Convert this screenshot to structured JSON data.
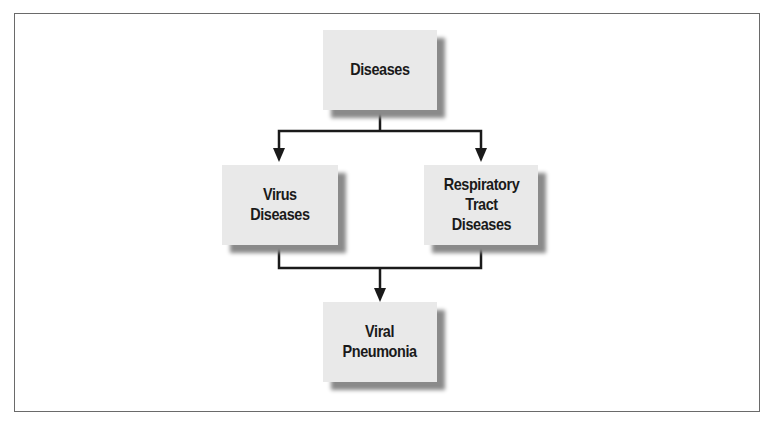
{
  "diagram": {
    "nodes": [
      {
        "id": "diseases",
        "label": "Diseases"
      },
      {
        "id": "virus-diseases",
        "label": "Virus\nDiseases"
      },
      {
        "id": "respiratory-tract-diseases",
        "label": "Respiratory\nTract\nDiseases"
      },
      {
        "id": "viral-pneumonia",
        "label": "Viral\nPneumonia"
      }
    ],
    "edges": [
      {
        "from": "diseases",
        "to": "virus-diseases"
      },
      {
        "from": "diseases",
        "to": "respiratory-tract-diseases"
      },
      {
        "from": "virus-diseases",
        "to": "viral-pneumonia"
      },
      {
        "from": "respiratory-tract-diseases",
        "to": "viral-pneumonia"
      }
    ],
    "colors": {
      "node_fill": "#e9e9e9",
      "node_shadow": "#8a8a8a",
      "line": "#1a1a1a",
      "frame": "#6a6a6a"
    }
  }
}
